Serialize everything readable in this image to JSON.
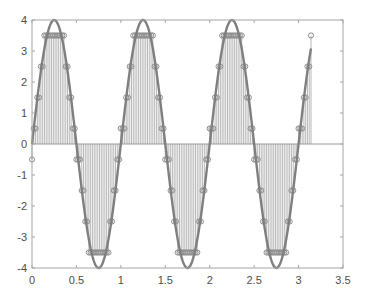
{
  "chart_data": {
    "type": "line",
    "title": "",
    "xlabel": "",
    "ylabel": "",
    "xlim": [
      0,
      3.5
    ],
    "ylim": [
      -4,
      4
    ],
    "xticks": [
      0,
      0.5,
      1,
      1.5,
      2,
      2.5,
      3,
      3.5
    ],
    "xtick_labels": [
      "0",
      "0.5",
      "1",
      "1.5",
      "2",
      "2.5",
      "3",
      "3.5"
    ],
    "yticks": [
      -4,
      -3,
      -2,
      -1,
      0,
      1,
      2,
      3,
      4
    ],
    "ytick_labels": [
      "-4",
      "-3",
      "-2",
      "-1",
      "0",
      "1",
      "2",
      "3",
      "4"
    ],
    "grid": false,
    "legend": null,
    "series": [
      {
        "name": "continuous signal",
        "style": "line",
        "formula": "4*sin(2*pi*t)",
        "amplitude": 4,
        "frequency_hz": 1,
        "t_start": 0,
        "t_end": 3.14,
        "color": "#7f7f7f"
      },
      {
        "name": "quantized samples",
        "style": "stem",
        "sample_spacing": 0.02,
        "t_start": 0,
        "t_end": 3.14,
        "quantization_levels": [
          -3.5,
          -2.5,
          -1.5,
          -0.5,
          0.5,
          1.5,
          2.5,
          3.5
        ],
        "color": "#8c8c8c"
      }
    ]
  },
  "colors": {
    "axis": "#a6a6a6",
    "curve": "#7f7f7f",
    "stem": "#9a9a9a",
    "marker": "#8c8c8c",
    "label": "#4d4d4d"
  }
}
